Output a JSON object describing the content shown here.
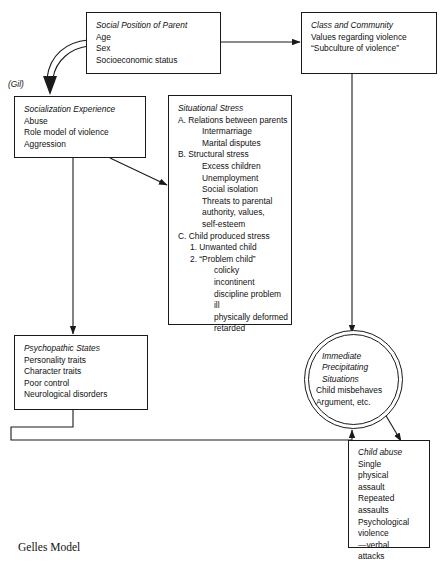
{
  "diagram": {
    "caption": "Gelles Model",
    "side_label": "(Gil)",
    "nodes": {
      "social_position": {
        "title": "Social Position of Parent",
        "lines": [
          "Age",
          "Sex",
          "Socioeconomic status"
        ]
      },
      "class_community": {
        "title": "Class and Community",
        "lines": [
          "Values regarding violence",
          "“Subculture of violence”"
        ]
      },
      "socialization": {
        "title": "Socialization Experience",
        "lines": [
          "Abuse",
          "Role model of violence",
          "Aggression"
        ]
      },
      "situational_stress": {
        "title": "Situational Stress",
        "lines": [
          "A. Relations between parents",
          "Intermarriage",
          "Marital disputes",
          "B. Structural stress",
          "Excess children",
          "Unemployment",
          "Social isolation",
          "Threats to parental",
          "authority, values,",
          "self-esteem",
          "C. Child produced stress",
          "1. Unwanted child",
          "2. “Problem child”",
          "colicky",
          "incontinent",
          "discipline problem",
          "ill",
          "physically deformed",
          "retarded"
        ]
      },
      "psychopathic": {
        "title": "Psychopathic States",
        "lines": [
          "Personality traits",
          "Character traits",
          "Poor control",
          "Neurological disorders"
        ]
      },
      "precipitating": {
        "title_lines": [
          "Immediate",
          "Precipitating",
          "Situations"
        ],
        "lines": [
          "Child misbehaves",
          "Argument, etc."
        ]
      },
      "child_abuse": {
        "title": "Child abuse",
        "lines": [
          "Single",
          "physical",
          "assault",
          "Repeated",
          "assaults",
          "Psychological",
          "violence",
          "—verbal",
          "attacks"
        ]
      }
    }
  }
}
